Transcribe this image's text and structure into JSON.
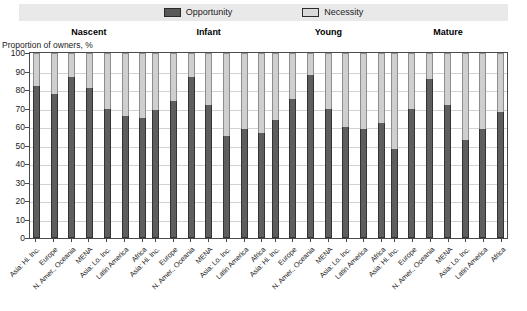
{
  "legend": {
    "items": [
      {
        "label": "Opportunity",
        "color": "#595959",
        "icon": "legend-swatch-opportunity"
      },
      {
        "label": "Necessity",
        "color": "#d9d9d9",
        "icon": "legend-swatch-necessity"
      }
    ]
  },
  "axis": {
    "y_title": "Proportion of owners, %",
    "ticks": [
      "100",
      "90",
      "80",
      "70",
      "60",
      "50",
      "40",
      "30",
      "20",
      "10",
      "0"
    ]
  },
  "chart_data": {
    "type": "bar",
    "subtype": "stacked-percentage",
    "title": "",
    "xlabel": "",
    "ylabel": "Proportion of owners, %",
    "ylim": [
      0,
      100
    ],
    "ytick_step": 10,
    "grid": true,
    "legend_position": "top-center",
    "legend_entries": [
      "Opportunity",
      "Necessity"
    ],
    "group_names": [
      "Nascent",
      "Infant",
      "Young",
      "Mature"
    ],
    "categories": [
      "Asia: Hi. Inc.",
      "Europe",
      "N. Amer., Oceania",
      "MENA",
      "Asia: Lo. Inc.",
      "Latin America",
      "Africa"
    ],
    "series": [
      {
        "name": "Opportunity",
        "color": "#595959",
        "groups": [
          {
            "group": "Nascent",
            "values": [
              82,
              78,
              87,
              81,
              70,
              66,
              65
            ]
          },
          {
            "group": "Infant",
            "values": [
              69,
              74,
              87,
              72,
              55,
              59,
              57
            ]
          },
          {
            "group": "Young",
            "values": [
              64,
              75,
              88,
              70,
              60,
              59,
              62
            ]
          },
          {
            "group": "Mature",
            "values": [
              48,
              70,
              86,
              72,
              53,
              59,
              68
            ]
          }
        ]
      },
      {
        "name": "Necessity",
        "color": "#d9d9d9",
        "groups": [
          {
            "group": "Nascent",
            "values": [
              18,
              22,
              13,
              19,
              30,
              34,
              35
            ]
          },
          {
            "group": "Infant",
            "values": [
              31,
              26,
              13,
              28,
              45,
              41,
              43
            ]
          },
          {
            "group": "Young",
            "values": [
              36,
              25,
              12,
              30,
              40,
              41,
              38
            ]
          },
          {
            "group": "Mature",
            "values": [
              52,
              30,
              14,
              28,
              47,
              41,
              32
            ]
          }
        ]
      }
    ]
  }
}
